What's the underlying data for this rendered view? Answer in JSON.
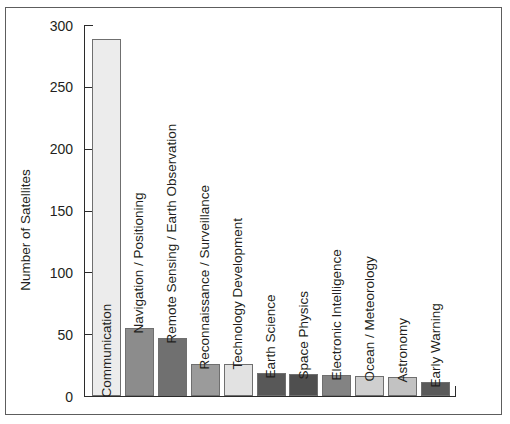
{
  "chart_data": {
    "type": "bar",
    "title": "",
    "xlabel": "",
    "ylabel": "Number of Satellites",
    "ylim": [
      0,
      300
    ],
    "yticks": [
      0,
      50,
      100,
      150,
      200,
      250,
      300
    ],
    "grid": false,
    "legend": false,
    "orientation": "vertical",
    "categories": [
      "Communication",
      "Navigation / Positioning",
      "Remote Sensing / Earth Observation",
      "Reconnaissance / Surveillance",
      "Technology Development",
      "Earth Science",
      "Space Physics",
      "Electronic Intelligence",
      "Ocean / Meteorology",
      "Astronomy",
      "Early Warning"
    ],
    "values": [
      289,
      55,
      47,
      26,
      26,
      19,
      18,
      17,
      16,
      15,
      11
    ],
    "bar_colors": [
      "#ececec",
      "#8c8c8c",
      "#707070",
      "#9b9b9b",
      "#e2e2e2",
      "#585858",
      "#4f4f4f",
      "#838383",
      "#cfcfcf",
      "#c2c2c2",
      "#5a5a5a"
    ],
    "bar_border_color": "#6f6f6f",
    "label_placement": [
      "inside",
      "above",
      "above",
      "above",
      "above",
      "above",
      "above",
      "above",
      "above",
      "above",
      "above"
    ]
  },
  "figure": {
    "background_color": "#ffffff",
    "frame_color": "#5d5d5d",
    "axis_color": "#2b2b2b",
    "text_color": "#231f20"
  }
}
